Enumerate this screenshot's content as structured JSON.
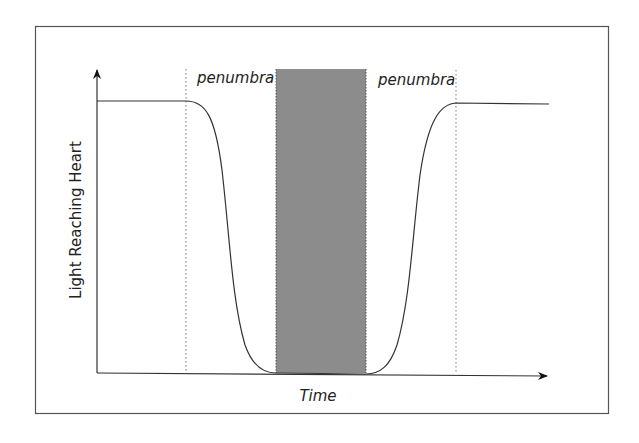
{
  "diagram": {
    "title": "",
    "y_axis_label": "Light Reaching Heart",
    "x_axis_label": "Time",
    "regions": [
      {
        "name": "penumbra-left",
        "label": "penumbra"
      },
      {
        "name": "umbra",
        "label": ""
      },
      {
        "name": "penumbra-right",
        "label": "penumbra"
      }
    ],
    "colors": {
      "umbra_fill": "#8c8c8c",
      "line": "#333333",
      "frame": "#555555"
    }
  }
}
